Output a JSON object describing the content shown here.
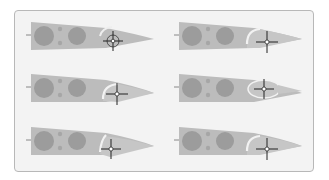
{
  "figure": {
    "layout": {
      "rows": 3,
      "columns": 2
    },
    "colors": {
      "card_background": "#f3f3f3",
      "card_border": "#b8b8b8",
      "wing_fill": "#b9b9b9",
      "hole_fill": "#9a9a9a",
      "flap_fill": "#c4c4c4",
      "crosshair": "#333333"
    },
    "panels": [
      {
        "id": "top-left",
        "flap_angle": "slight",
        "target": {
          "x": 113,
          "y": 42
        }
      },
      {
        "id": "top-right",
        "flap_angle": "arc",
        "target": {
          "x": 267,
          "y": 42
        }
      },
      {
        "id": "middle-left",
        "flap_angle": "arc",
        "target": {
          "x": 117,
          "y": 94
        }
      },
      {
        "id": "middle-right",
        "flap_angle": "ellipse",
        "target": {
          "x": 264,
          "y": 89
        }
      },
      {
        "id": "bottom-left",
        "flap_angle": "slight",
        "target": {
          "x": 111,
          "y": 149
        }
      },
      {
        "id": "bottom-right",
        "flap_angle": "arc",
        "target": {
          "x": 267,
          "y": 149
        }
      }
    ]
  }
}
